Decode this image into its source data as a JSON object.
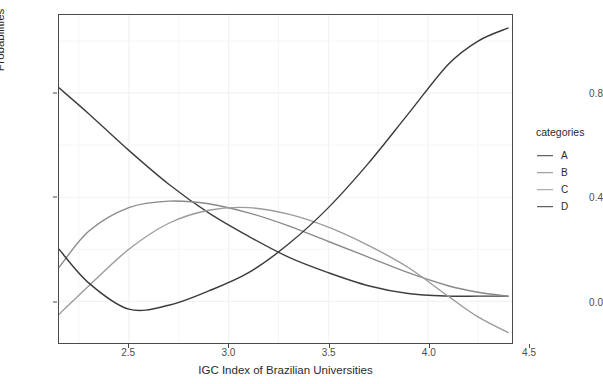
{
  "chart_data": {
    "type": "line",
    "title": "",
    "xlabel": "IGC Index of Brazilian Universities",
    "ylabel": "Probabilities",
    "xlim": [
      2.15,
      4.42
    ],
    "ylim": [
      -0.16,
      1.1
    ],
    "xticks": [
      "2.5",
      "3.0",
      "3.5",
      "4.0",
      "4.5"
    ],
    "xtick_values": [
      2.5,
      3.0,
      3.5,
      4.0,
      4.5
    ],
    "yticks": [
      "0.0",
      "0.4",
      "0.8"
    ],
    "ytick_values": [
      0.0,
      0.4,
      0.8
    ],
    "grid": true,
    "legend_position": "right",
    "legend_title": "categories",
    "x": [
      2.15,
      2.3,
      2.5,
      2.7,
      2.9,
      3.1,
      3.3,
      3.5,
      3.7,
      3.9,
      4.1,
      4.25,
      4.4
    ],
    "series": [
      {
        "name": "A",
        "color": "#3f3f3f",
        "values": [
          0.82,
          0.72,
          0.58,
          0.45,
          0.34,
          0.25,
          0.17,
          0.11,
          0.06,
          0.03,
          0.02,
          0.02,
          0.02
        ]
      },
      {
        "name": "B",
        "color": "#8a8a8a",
        "values": [
          0.13,
          0.27,
          0.36,
          0.385,
          0.375,
          0.34,
          0.29,
          0.23,
          0.17,
          0.11,
          0.06,
          0.035,
          0.02
        ]
      },
      {
        "name": "C",
        "color": "#9b9b9b",
        "values": [
          -0.05,
          0.06,
          0.2,
          0.3,
          0.35,
          0.36,
          0.335,
          0.285,
          0.215,
          0.13,
          0.02,
          -0.06,
          -0.12
        ]
      },
      {
        "name": "D",
        "color": "#3a3a3a",
        "values": [
          0.2,
          0.07,
          -0.03,
          -0.015,
          0.04,
          0.11,
          0.22,
          0.36,
          0.53,
          0.72,
          0.91,
          1.0,
          1.05
        ]
      }
    ]
  },
  "axes": {
    "y_title": "Probabilities",
    "x_title": "IGC Index of Brazilian Universities",
    "y_tick_labels": [
      "0.0",
      "0.4",
      "0.8"
    ],
    "x_tick_labels": [
      "2.5",
      "3.0",
      "3.5",
      "4.0",
      "4.5"
    ]
  },
  "legend": {
    "title": "categories",
    "items": [
      {
        "label": "A",
        "color": "#3f3f3f"
      },
      {
        "label": "B",
        "color": "#8a8a8a"
      },
      {
        "label": "C",
        "color": "#9b9b9b"
      },
      {
        "label": "D",
        "color": "#3a3a3a"
      }
    ]
  },
  "style": {
    "panel_background": "#ffffff",
    "panel_border": "#4a4a4a",
    "grid_color": "#f2f2f2",
    "text_color": "#2b2b2b",
    "tick_color": "#4d4d4d"
  }
}
